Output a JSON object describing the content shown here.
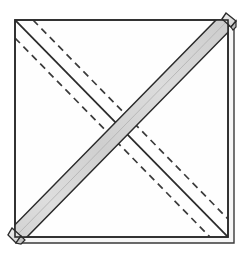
{
  "figure": {
    "kind": "instructional-fold-diagram",
    "canvas": {
      "width": 249,
      "height": 255
    },
    "palette": {
      "background": "#ffffff",
      "paper_face": "#fefefe",
      "paper_under": "#f7f7f7",
      "band_light": "#e6e6e6",
      "band_mid": "#d4d4d4",
      "band_dark": "#c2c2c2",
      "outline": "#2b2b2b",
      "outline_soft": "#555555",
      "crease_dash": "#3a3a3a"
    },
    "square": {
      "label": "napkin-outline",
      "top_left": [
        15,
        20
      ],
      "top_right": [
        228,
        20
      ],
      "bottom_right": [
        228,
        237
      ],
      "bottom_left": [
        15,
        237
      ],
      "stroke_width": 1.6
    },
    "under_layer": {
      "label": "underlying-layer-edge",
      "right_edge_x": 234,
      "bottom_edge_y": 243,
      "stroke_width": 1.4
    },
    "band": {
      "label": "folded-strip",
      "direction": "bottom-left-to-top-right",
      "start": [
        15,
        237
      ],
      "end": [
        228,
        20
      ],
      "width_px": 17,
      "fill": "#d8d8d8",
      "stroke": "#2b2b2b",
      "stroke_width": 1.5
    },
    "band_tips": [
      {
        "name": "tip-top-right",
        "at": [
          228,
          20
        ]
      },
      {
        "name": "tip-bottom-left",
        "at": [
          15,
          237
        ]
      }
    ],
    "diagonal_solid": {
      "label": "main-crease-diagonal",
      "from": [
        15,
        20
      ],
      "to": [
        228,
        237
      ],
      "stroke": "#2b2b2b",
      "stroke_width": 1.8,
      "style": "solid"
    },
    "dashed_creases": [
      {
        "name": "dashed-crease-upper",
        "from": [
          15,
          38
        ],
        "to": [
          210,
          237
        ],
        "offset_px": 17,
        "side": "below",
        "style": "dashed"
      },
      {
        "name": "dashed-crease-lower",
        "from": [
          33,
          20
        ],
        "to": [
          228,
          219
        ],
        "offset_px": 17,
        "side": "above",
        "style": "dashed"
      }
    ],
    "dash_pattern": {
      "dash": 7,
      "gap": 5,
      "stroke_width": 1.7
    }
  }
}
